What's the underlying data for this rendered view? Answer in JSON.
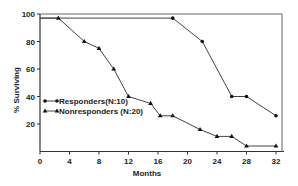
{
  "chart_data": {
    "type": "line",
    "title": "",
    "xlabel": "Months",
    "ylabel": "% Surviving",
    "xlim": [
      0,
      32
    ],
    "ylim": [
      0,
      100
    ],
    "x_ticks": [
      0,
      4,
      8,
      12,
      16,
      20,
      24,
      28,
      32
    ],
    "y_ticks": [
      20,
      40,
      60,
      80,
      100
    ],
    "grid": false,
    "legend_position": "inside-left-middle",
    "series": [
      {
        "name": "Responders(N:10)",
        "marker": "circle",
        "points": [
          [
            0,
            97
          ],
          [
            18,
            97
          ],
          [
            22,
            80
          ],
          [
            26,
            40
          ],
          [
            28,
            40
          ],
          [
            32,
            26
          ]
        ]
      },
      {
        "name": "Nonresponders (N:20)",
        "marker": "triangle",
        "points": [
          [
            0,
            97
          ],
          [
            2.5,
            97
          ],
          [
            6,
            80
          ],
          [
            8,
            75
          ],
          [
            10,
            60
          ],
          [
            12,
            40
          ],
          [
            15,
            35
          ],
          [
            16.3,
            26
          ],
          [
            18,
            26
          ],
          [
            21.7,
            16
          ],
          [
            24,
            11
          ],
          [
            26,
            11
          ],
          [
            28,
            4
          ],
          [
            32,
            4
          ]
        ]
      }
    ]
  },
  "colors": {
    "line": "#444444",
    "axis": "#333333",
    "text": "#222222",
    "background": "#ffffff"
  }
}
